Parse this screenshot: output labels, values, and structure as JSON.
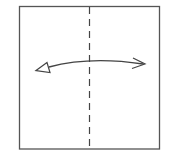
{
  "diagram": {
    "type": "origami-fold-instruction",
    "paper": {
      "shape": "square",
      "stroke": "#555555",
      "fill": "#ffffff"
    },
    "fold_line": {
      "style": "valley-fold-dashed",
      "orientation": "vertical",
      "color": "#444444"
    },
    "arrow": {
      "style": "double-headed-curved",
      "meaning": "fold-and-unfold",
      "color": "#444444"
    }
  }
}
